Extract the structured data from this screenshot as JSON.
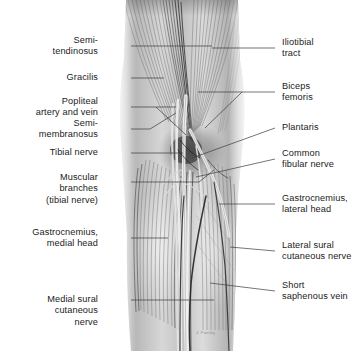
{
  "figure": {
    "background_color": "#ffffff",
    "label_color": "#1b1b1b",
    "leader_color": "#3b3b3b",
    "credit": "J. Pansky"
  },
  "labels_left": [
    {
      "id": "semitendinosus",
      "lines": [
        "Semi-",
        "tendinosus"
      ],
      "x": 98,
      "y": 46
    },
    {
      "id": "gracilis",
      "lines": [
        "Gracilis"
      ],
      "x": 98,
      "y": 78
    },
    {
      "id": "popliteal-artery-vein",
      "lines": [
        "Popliteal",
        "artery and vein"
      ],
      "x": 98,
      "y": 107
    },
    {
      "id": "semimembranosus",
      "lines": [
        "Semi-",
        "membranosus"
      ],
      "x": 98,
      "y": 129
    },
    {
      "id": "tibial-nerve",
      "lines": [
        "Tibial nerve"
      ],
      "x": 98,
      "y": 153
    },
    {
      "id": "muscular-branches",
      "lines": [
        "Muscular",
        "branches",
        "(tibial nerve)"
      ],
      "x": 98,
      "y": 189
    },
    {
      "id": "gastrocnemius-medial",
      "lines": [
        "Gastrocnemius,",
        "medial head"
      ],
      "x": 98,
      "y": 238
    },
    {
      "id": "medial-sural-nerve",
      "lines": [
        "Medial sural",
        "cutaneous",
        "nerve"
      ],
      "x": 98,
      "y": 311
    }
  ],
  "labels_right": [
    {
      "id": "iliotibial-tract",
      "lines": [
        "Iliotibial",
        "tract"
      ],
      "x": 282,
      "y": 48
    },
    {
      "id": "biceps-femoris",
      "lines": [
        "Biceps",
        "femoris"
      ],
      "x": 282,
      "y": 92
    },
    {
      "id": "plantaris",
      "lines": [
        "Plantaris"
      ],
      "x": 282,
      "y": 128
    },
    {
      "id": "common-fibular-nerve",
      "lines": [
        "Common",
        "fibular nerve"
      ],
      "x": 282,
      "y": 159
    },
    {
      "id": "gastrocnemius-lateral",
      "lines": [
        "Gastrocnemius,",
        "lateral head"
      ],
      "x": 282,
      "y": 204
    },
    {
      "id": "lateral-sural-nerve",
      "lines": [
        "Lateral sural",
        "cutaneous nerve"
      ],
      "x": 282,
      "y": 251
    },
    {
      "id": "short-saphenous-vein",
      "lines": [
        "Short",
        "saphenous vein"
      ],
      "x": 282,
      "y": 291
    }
  ],
  "leaders": [
    {
      "id": "leader-semitendinosus",
      "path": "M 131,46 L 212,46"
    },
    {
      "id": "leader-gracilis",
      "path": "M 131,78 L 164,78"
    },
    {
      "id": "leader-popliteal-artery-vein",
      "path": "M 131,107 L 176,107 M 156,107 L 186,135"
    },
    {
      "id": "leader-semimembranosus",
      "path": "M 131,129 L 150,129 M 150,129 L 176,113"
    },
    {
      "id": "leader-tibial-nerve",
      "path": "M 131,153 L 183,153"
    },
    {
      "id": "leader-muscular-branches",
      "path": "M 131,182 L 199,182 M 199,182 L 214,170"
    },
    {
      "id": "leader-gastrocnemius-medial",
      "path": "M 131,238 L 168,238"
    },
    {
      "id": "leader-medial-sural-nerve",
      "path": "M 131,300 L 214,300"
    },
    {
      "id": "leader-iliotibial-tract",
      "path": "M 275,48 L 212,48"
    },
    {
      "id": "leader-biceps-femoris",
      "path": "M 275,92 L 198,92 M 242,92 L 205,128"
    },
    {
      "id": "leader-plantaris",
      "path": "M 275,128 L 192,158"
    },
    {
      "id": "leader-common-fibular-nerve",
      "path": "M 275,159 L 196,177"
    },
    {
      "id": "leader-gastrocnemius-lateral",
      "path": "M 275,204 L 219,204"
    },
    {
      "id": "leader-lateral-sural-nerve",
      "path": "M 275,251 L 230,247"
    },
    {
      "id": "leader-short-saphenous-vein",
      "path": "M 275,291 L 210,283"
    }
  ]
}
